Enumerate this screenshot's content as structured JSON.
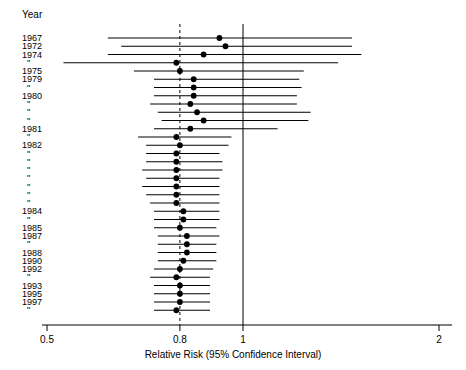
{
  "chart_data": {
    "type": "scatter",
    "title": "",
    "xlabel": "Relative Risk (95% Confidence Interval)",
    "ylabel": "Year",
    "xscale": "log",
    "xlim": [
      0.47,
      2.1
    ],
    "xticks": [
      0.5,
      0.8,
      1,
      2
    ],
    "xticklabels": [
      "0.5",
      "0.8",
      "1",
      "2"
    ],
    "grid": false,
    "legend": null,
    "reference_lines": [
      {
        "value": 0.8,
        "style": "dashed"
      },
      {
        "value": 1.0,
        "style": "solid"
      }
    ],
    "column_header": "Year",
    "categories": [
      "1967",
      "1972",
      "1974",
      "\"",
      "1975",
      "1979",
      "\"",
      "1980",
      "\"",
      "\"",
      "\"",
      "1981",
      "\"",
      "1982",
      "\"",
      "\"",
      "\"",
      "\"",
      "\"",
      "\"",
      "\"",
      "1984",
      "\"",
      "1985",
      "1987",
      "\"",
      "1988",
      "1990",
      "1992",
      "\"",
      "1993",
      "1995",
      "1997",
      "\""
    ],
    "series": [
      {
        "name": "Relative Risk",
        "points": [
          {
            "year": "1967",
            "rr": 0.92,
            "low": 0.62,
            "high": 1.47
          },
          {
            "year": "1972",
            "rr": 0.94,
            "low": 0.65,
            "high": 1.47
          },
          {
            "year": "1974",
            "rr": 0.87,
            "low": 0.62,
            "high": 1.52
          },
          {
            "year": "\"",
            "rr": 0.79,
            "low": 0.53,
            "high": 1.4
          },
          {
            "year": "1975",
            "rr": 0.8,
            "low": 0.68,
            "high": 1.24
          },
          {
            "year": "1979",
            "rr": 0.84,
            "low": 0.73,
            "high": 1.22
          },
          {
            "year": "\"",
            "rr": 0.84,
            "low": 0.73,
            "high": 1.23
          },
          {
            "year": "1980",
            "rr": 0.84,
            "low": 0.73,
            "high": 1.21
          },
          {
            "year": "\"",
            "rr": 0.83,
            "low": 0.72,
            "high": 1.21
          },
          {
            "year": "\"",
            "rr": 0.85,
            "low": 0.74,
            "high": 1.27
          },
          {
            "year": "\"",
            "rr": 0.87,
            "low": 0.75,
            "high": 1.26
          },
          {
            "year": "1981",
            "rr": 0.83,
            "low": 0.73,
            "high": 1.13
          },
          {
            "year": "\"",
            "rr": 0.79,
            "low": 0.69,
            "high": 0.96
          },
          {
            "year": "1982",
            "rr": 0.8,
            "low": 0.71,
            "high": 0.95
          },
          {
            "year": "\"",
            "rr": 0.79,
            "low": 0.71,
            "high": 0.92
          },
          {
            "year": "\"",
            "rr": 0.79,
            "low": 0.71,
            "high": 0.93
          },
          {
            "year": "\"",
            "rr": 0.79,
            "low": 0.7,
            "high": 0.93
          },
          {
            "year": "\"",
            "rr": 0.79,
            "low": 0.71,
            "high": 0.92
          },
          {
            "year": "\"",
            "rr": 0.79,
            "low": 0.7,
            "high": 0.92
          },
          {
            "year": "\"",
            "rr": 0.79,
            "low": 0.71,
            "high": 0.92
          },
          {
            "year": "\"",
            "rr": 0.79,
            "low": 0.72,
            "high": 0.92
          },
          {
            "year": "1984",
            "rr": 0.81,
            "low": 0.73,
            "high": 0.92
          },
          {
            "year": "\"",
            "rr": 0.81,
            "low": 0.73,
            "high": 0.92
          },
          {
            "year": "1985",
            "rr": 0.8,
            "low": 0.73,
            "high": 0.91
          },
          {
            "year": "1987",
            "rr": 0.82,
            "low": 0.74,
            "high": 0.92
          },
          {
            "year": "\"",
            "rr": 0.82,
            "low": 0.74,
            "high": 0.91
          },
          {
            "year": "1988",
            "rr": 0.82,
            "low": 0.74,
            "high": 0.91
          },
          {
            "year": "1990",
            "rr": 0.81,
            "low": 0.74,
            "high": 0.91
          },
          {
            "year": "1992",
            "rr": 0.8,
            "low": 0.73,
            "high": 0.9
          },
          {
            "year": "\"",
            "rr": 0.79,
            "low": 0.72,
            "high": 0.89
          },
          {
            "year": "1993",
            "rr": 0.8,
            "low": 0.73,
            "high": 0.89
          },
          {
            "year": "1995",
            "rr": 0.8,
            "low": 0.73,
            "high": 0.89
          },
          {
            "year": "1997",
            "rr": 0.8,
            "low": 0.73,
            "high": 0.89
          },
          {
            "year": "\"",
            "rr": 0.79,
            "low": 0.73,
            "high": 0.89
          }
        ]
      }
    ]
  },
  "colors": {
    "line": "#000000",
    "marker": "#000000",
    "axis": "#000000",
    "background": "#ffffff"
  }
}
